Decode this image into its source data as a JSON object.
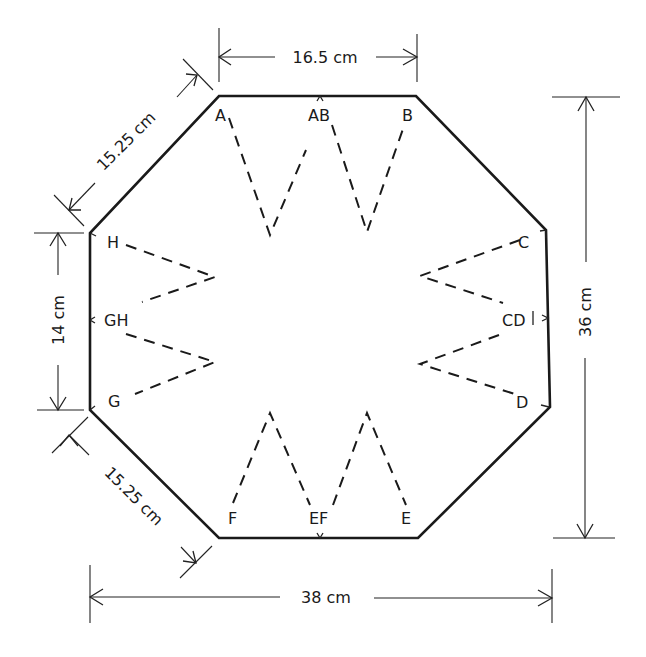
{
  "diagram": {
    "type": "octagonal pattern with darts",
    "points": {
      "A": "A",
      "AB": "AB",
      "B": "B",
      "C": "C",
      "CD": "CD",
      "D": "D",
      "E": "E",
      "EF": "EF",
      "F": "F",
      "G": "G",
      "GH": "GH",
      "H": "H"
    },
    "dimensions": {
      "top_edge": "16.5 cm",
      "upper_left_diagonal": "15.25 cm",
      "left_edge": "14 cm",
      "lower_left_diagonal": "15.25 cm",
      "overall_height": "36 cm",
      "overall_width": "38 cm"
    },
    "colors": {
      "line": "#1a1a1a",
      "background": "#ffffff"
    }
  }
}
